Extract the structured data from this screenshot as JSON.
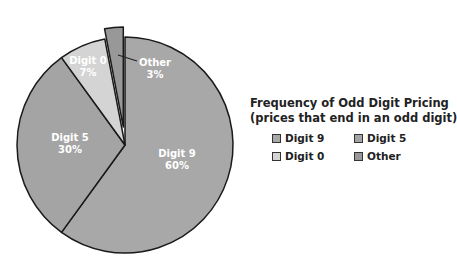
{
  "chart_data": {
    "type": "pie",
    "title": "Frequency of Odd Digit Pricing",
    "subtitle": "(prices that end in an odd digit)",
    "categories": [
      "Digit 9",
      "Digit 5",
      "Digit 0",
      "Other"
    ],
    "values": [
      60,
      30,
      7,
      3
    ],
    "unit": "%",
    "colors": [
      "#a8a8a8",
      "#a4a4a4",
      "#d4d4d4",
      "#989898"
    ],
    "exploded": [
      "Other"
    ],
    "legend_position": "right",
    "labels": [
      {
        "name": "Digit 9",
        "pct": "60%"
      },
      {
        "name": "Digit 5",
        "pct": "30%"
      },
      {
        "name": "Digit 0",
        "pct": "7%"
      },
      {
        "name": "Other",
        "pct": "3%"
      }
    ]
  },
  "legend": {
    "title": "Frequency of Odd Digit Pricing",
    "subtitle": "(prices that end in an odd digit)",
    "items": [
      {
        "label": "Digit 9",
        "color": "#a8a8a8"
      },
      {
        "label": "Digit 5",
        "color": "#a4a4a4"
      },
      {
        "label": "Digit 0",
        "color": "#d4d4d4"
      },
      {
        "label": "Other",
        "color": "#989898"
      }
    ]
  }
}
